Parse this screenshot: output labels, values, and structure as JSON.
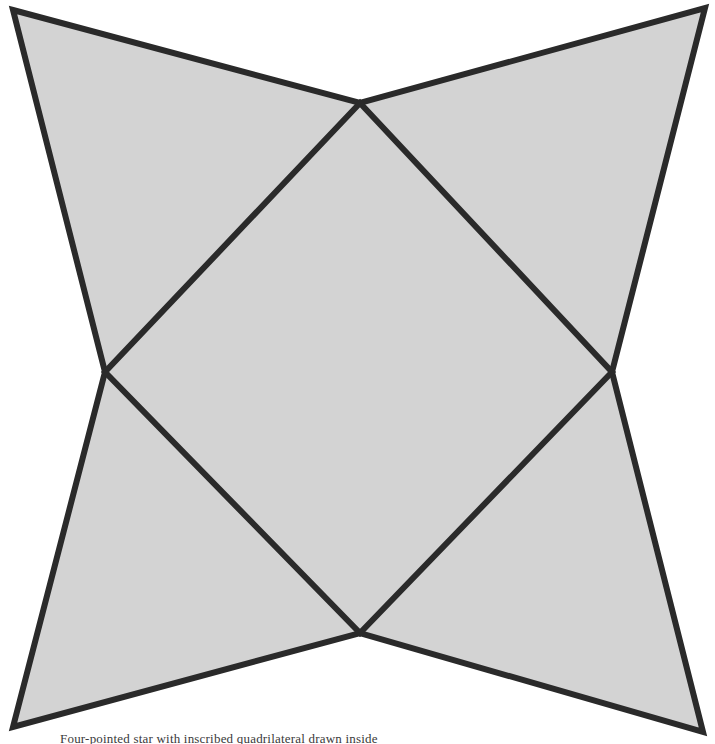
{
  "figure": {
    "title": "Four-pointed star with inscribed quadrilateral",
    "canvas": {
      "width": 715,
      "height": 744,
      "background": "#ffffff"
    },
    "style": {
      "fill": "#d3d3d3",
      "stroke": "#2a2a2a",
      "stroke_width": 6,
      "inner_stroke_width": 6
    },
    "outer_points": [
      {
        "name": "top-left-point",
        "x": 13,
        "y": 10
      },
      {
        "name": "top-right-point",
        "x": 705,
        "y": 8
      },
      {
        "name": "bottom-right-point",
        "x": 703,
        "y": 732
      },
      {
        "name": "bottom-left-point",
        "x": 13,
        "y": 727
      }
    ],
    "notch_points": [
      {
        "name": "top-notch",
        "x": 360,
        "y": 103
      },
      {
        "name": "right-notch",
        "x": 612,
        "y": 372
      },
      {
        "name": "bottom-notch",
        "x": 360,
        "y": 633
      },
      {
        "name": "left-notch",
        "x": 105,
        "y": 372
      }
    ],
    "star_path": "M 13 10 L 360 103 L 705 8 L 612 372 L 703 732 L 360 633 L 13 727 L 105 372 Z",
    "inner_quad_path": "M 360 103 L 612 372 L 360 633 L 105 372 Z"
  },
  "caption": {
    "text": "Four-pointed star with inscribed quadrilateral drawn inside"
  }
}
